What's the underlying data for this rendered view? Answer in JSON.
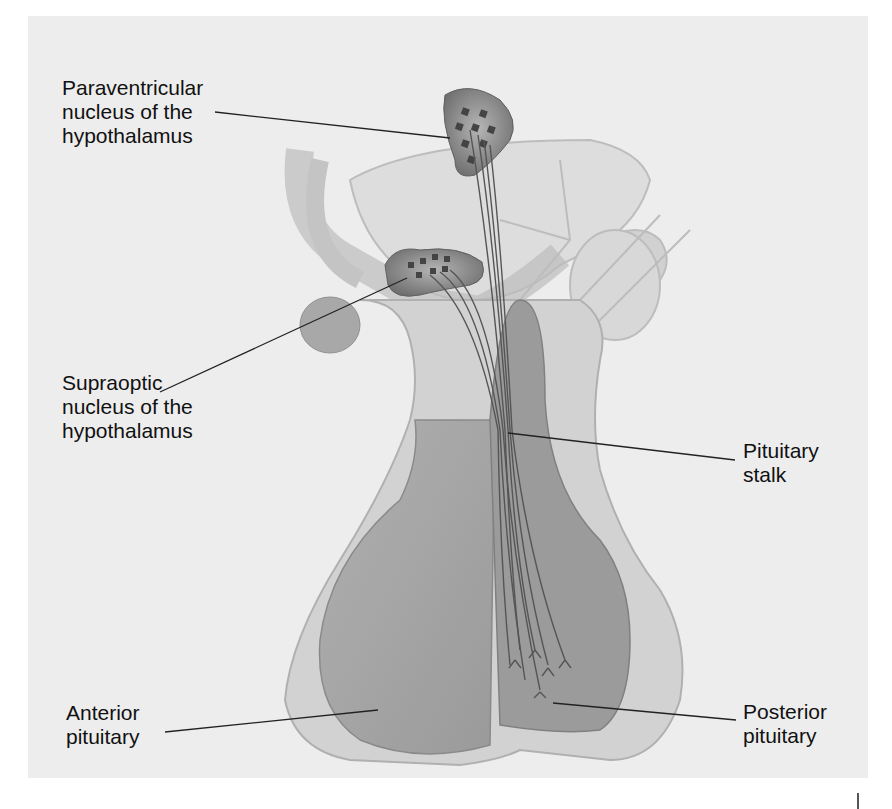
{
  "diagram": {
    "labels": {
      "paraventricular": "Paraventricular\nnucleus of the\nhypothalamus",
      "supraoptic": "Supraoptic\nnucleus of the\nhypothalamus",
      "pituitary_stalk": "Pituitary\nstalk",
      "anterior_pituitary": "Anterior\npituitary",
      "posterior_pituitary": "Posterior\npituitary"
    },
    "colors": {
      "background": "#ededed",
      "tissue_light": "#d9d9d9",
      "tissue_mid": "#a6a6a6",
      "tissue_dark": "#8f8f8f",
      "nucleus": "#707070",
      "axon": "#555555",
      "leader_line": "#222222"
    }
  }
}
